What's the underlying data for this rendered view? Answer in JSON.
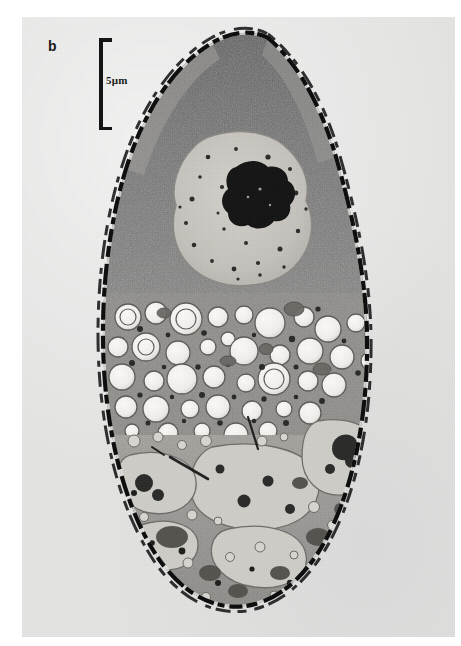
{
  "figure": {
    "panel_letter": "b",
    "scale_bar_label": "5μm",
    "scale_bar_value": "5",
    "scale_bar_unit": "μm",
    "caption_visible": "",
    "image_type": "transmission electron micrograph",
    "background_color": "#e4e4e3",
    "ink_color": "#141414"
  },
  "micrograph": {
    "specimen_outline": "elongate ovoid cell, pointed apex at top, rounded base at bottom",
    "cell_wall": {
      "name": "cell-wall",
      "appearance": "dark beaded / dashed electron-dense layer outlining the cell",
      "color": "#0d0d0d"
    },
    "regions": [
      {
        "name": "apical-cytoplasm",
        "label": "dense granular cytoplasm",
        "tone": "dark gray, finely granular",
        "color": "#6f6f6f"
      },
      {
        "name": "nucleus",
        "label": "nucleus",
        "tone": "pale, speckled nucleoplasm",
        "color": "#c9c7c2"
      },
      {
        "name": "nucleolus",
        "label": "nucleolus",
        "tone": "very electron-dense irregular mass",
        "color": "#161616"
      },
      {
        "name": "vacuole-zone",
        "label": "lipid bodies / vacuoles",
        "tone": "numerous round electron-lucent bodies",
        "color": "#f2f1ee"
      },
      {
        "name": "basal-cytoplasm",
        "label": "basal cytoplasm with storage vacuoles and dense granules",
        "tone": "mid gray with large pale vacuoles",
        "color": "#9a9893"
      }
    ]
  }
}
